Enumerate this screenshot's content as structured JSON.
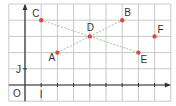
{
  "diagram": {
    "type": "coordinate-grid",
    "grid": {
      "cols": 10,
      "rows": 6,
      "x_min": -1,
      "x_max": 9,
      "y_min": -1,
      "y_max": 5,
      "line_color": "#c8c8c8"
    },
    "axes": {
      "origin_label": "O",
      "x_unit_label": "I",
      "y_unit_label": "J",
      "color": "#333333"
    },
    "points": [
      {
        "name": "A",
        "x": 2,
        "y": 2
      },
      {
        "name": "B",
        "x": 6,
        "y": 4
      },
      {
        "name": "C",
        "x": 1,
        "y": 4
      },
      {
        "name": "D",
        "x": 4,
        "y": 3
      },
      {
        "name": "E",
        "x": 7,
        "y": 2
      },
      {
        "name": "F",
        "x": 8,
        "y": 3
      }
    ],
    "segments": [
      {
        "from": "C",
        "to": "D"
      },
      {
        "from": "D",
        "to": "E"
      },
      {
        "from": "A",
        "to": "D"
      },
      {
        "from": "D",
        "to": "B"
      }
    ],
    "point_color": "#e0483a",
    "segment_color": "#9cc79a"
  }
}
